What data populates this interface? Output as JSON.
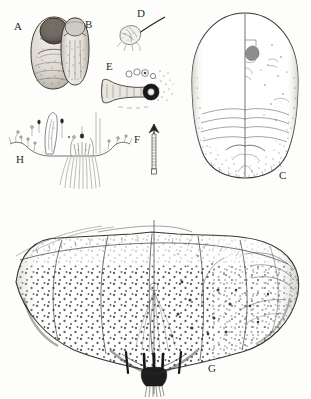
{
  "plate": {
    "title": "Armored scale insect taxonomic plate",
    "width": 311,
    "height": 399,
    "background_color": "#fdfdfb",
    "ink_color": "#3a3a3a",
    "style": "stippled pen-and-ink line drawing",
    "figures": [
      {
        "id": "A",
        "label": "A",
        "name": "female-scale-cover",
        "description": "Oval pear-shaped female scale cover with darker exuviae at apex",
        "label_x": 17,
        "label_y": 28
      },
      {
        "id": "B",
        "label": "B",
        "name": "male-scale-cover",
        "description": "Elongate male scale cover with terminal exuvia",
        "label_x": 88,
        "label_y": 25
      },
      {
        "id": "C",
        "label": "C",
        "name": "adult-female-body",
        "description": "Adult female body outline, broadly oval, with median line and segmentation",
        "label_x": 283,
        "label_y": 177
      },
      {
        "id": "D",
        "label": "D",
        "name": "antenna-detail",
        "description": "Antenna with long curved seta",
        "label_x": 140,
        "label_y": 14
      },
      {
        "id": "E",
        "label": "E",
        "name": "anterior-spiracle-detail",
        "description": "Anterior spiracle with associated disc pores",
        "label_x": 109,
        "label_y": 67
      },
      {
        "id": "F",
        "label": "F",
        "name": "gland-spine-detail",
        "description": "Elongate gland spine / marginal macroduct",
        "label_x": 137,
        "label_y": 141
      },
      {
        "id": "G",
        "label": "G",
        "name": "pygidium-detail",
        "description": "Pygidium with stippled lobes, marginal setae and dense gland ducts",
        "label_x": 212,
        "label_y": 370
      },
      {
        "id": "H",
        "label": "H",
        "name": "pygidial-margin-detail",
        "description": "Pygidial margin with median lobes, plates and gland spines",
        "label_x": 20,
        "label_y": 160
      }
    ]
  }
}
